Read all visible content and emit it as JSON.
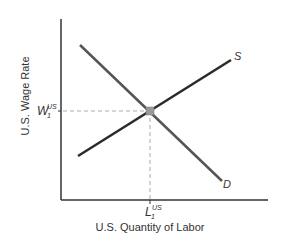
{
  "diagram": {
    "type": "supply-demand",
    "y_axis_label": "U.S. Wage Rate",
    "x_axis_label": "U.S. Quantity of Labor",
    "equilibrium_wage_label": {
      "main": "W",
      "sub": "1",
      "sup": "US"
    },
    "equilibrium_quantity_label": {
      "main": "L",
      "sub": "1",
      "sup": "US"
    },
    "supply_label": "S",
    "demand_label": "D",
    "colors": {
      "axis": "#333333",
      "supply": "#2a2a2a",
      "demand": "#555555",
      "guide": "#aaaaaa",
      "equilibrium_point": "#999999"
    }
  }
}
